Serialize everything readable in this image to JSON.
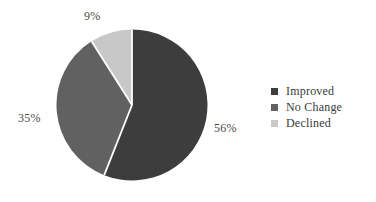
{
  "chart_data": {
    "type": "pie",
    "title": "",
    "categories": [
      "Improved",
      "No Change",
      "Declined"
    ],
    "values": [
      56,
      35,
      9
    ],
    "value_unit": "%",
    "data_labels": [
      "56%",
      "35%",
      "9%"
    ],
    "colors": [
      "#3d3d3d",
      "#616161",
      "#c8c8c8"
    ],
    "slice_separator_color": "#ffffff",
    "start_angle_deg": 0,
    "direction": "clockwise",
    "legend_position": "right",
    "grid": false,
    "xlabel": "",
    "ylabel": ""
  },
  "labels": {
    "improved_pct": "56%",
    "nochange_pct": "35%",
    "declined_pct": "9%"
  },
  "legend": {
    "items": [
      {
        "label": "Improved",
        "color": "#3d3d3d",
        "value": "56%"
      },
      {
        "label": "No Change",
        "color": "#616161",
        "value": "35%"
      },
      {
        "label": "Declined",
        "color": "#c8c8c8",
        "value": "9%"
      }
    ]
  },
  "colors": {
    "background": "#ffffff",
    "label_text": "#4a4a4a",
    "legend_text": "#3a3a3a",
    "improved": "#3d3d3d",
    "no_change": "#616161",
    "declined": "#c8c8c8",
    "separator": "#ffffff"
  }
}
